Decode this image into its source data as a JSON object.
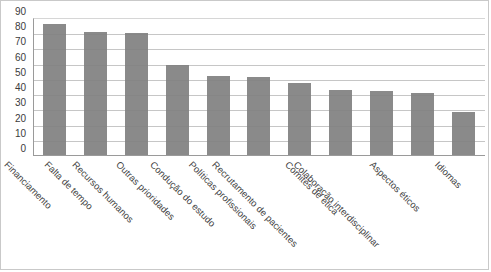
{
  "chart_data": {
    "type": "bar",
    "title": "",
    "xlabel": "",
    "ylabel": "",
    "ylim": [
      0,
      90
    ],
    "yticks": [
      90,
      80,
      70,
      60,
      50,
      40,
      30,
      20,
      10,
      0
    ],
    "grid": true,
    "legend": false,
    "bar_color": "#808080",
    "categories": [
      "Financiamento",
      "Falta de tempo",
      "Recursos humanos",
      "Outras prioridades",
      "Condução do estudo",
      "Políticas profissionais",
      "Recrutamento de pacientes",
      "Comités de ética",
      "Colaboração interdisciplinar",
      "Aspectos éticos",
      "Idiomas"
    ],
    "values": [
      86,
      81,
      80,
      59,
      52,
      51,
      47,
      43,
      42,
      41,
      28
    ]
  }
}
